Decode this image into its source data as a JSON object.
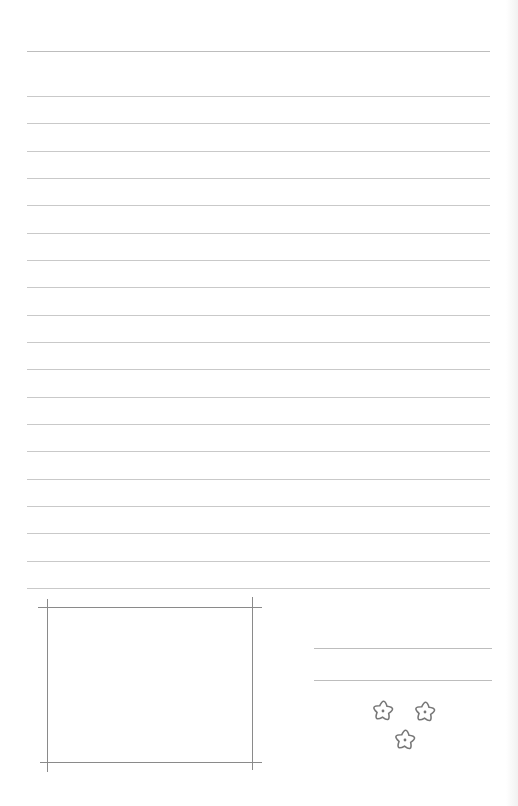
{
  "page": {
    "type": "lined-stationery",
    "background": "#ffffff",
    "rule_color": "#c9c9c9",
    "frame_color": "#8a8a8a"
  },
  "writing_area": {
    "header_line_y": 51,
    "first_line_y": 96,
    "line_spacing": 27.33,
    "line_count": 19,
    "x_start": 27,
    "x_end": 490
  },
  "photo_frame": {
    "label": "",
    "left": 47,
    "right": 252,
    "top": 607,
    "bottom": 762
  },
  "signature_lines": [
    {
      "y": 648,
      "x1": 314,
      "x2": 492,
      "value": ""
    },
    {
      "y": 680,
      "x1": 314,
      "x2": 492,
      "value": ""
    }
  ],
  "decoration": {
    "icon": "flower-cluster-icon",
    "flowers": [
      {
        "cx": 383,
        "cy": 711
      },
      {
        "cx": 425,
        "cy": 712
      },
      {
        "cx": 405,
        "cy": 740
      }
    ],
    "stroke": "#777777"
  }
}
